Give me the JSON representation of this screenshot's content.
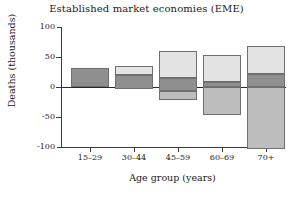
{
  "chart_data": {
    "type": "bar",
    "title": "Established market economies (EME)",
    "xlabel": "Age group (years)",
    "ylabel": "Deaths (thousands)",
    "categories": [
      "15–29",
      "30–44",
      "45–59",
      "60–69",
      "70+"
    ],
    "yticks": [
      100,
      50,
      0,
      -50,
      -100
    ],
    "ylim": [
      -100,
      100
    ],
    "grid": false,
    "legend": "none",
    "stacked": true,
    "series": [
      {
        "name": "upper-light-segment",
        "color": "#e3e3e3",
        "values": [
          0,
          15,
          44,
          46,
          47
        ]
      },
      {
        "name": "middle-dark-segment",
        "color": "#8f8f8f",
        "values": [
          32,
          24,
          22,
          8,
          22
        ]
      },
      {
        "name": "lower-gray-segment",
        "color": "#bdbdbd",
        "values": [
          0,
          -3,
          -22,
          -46,
          -104
        ]
      }
    ],
    "bars": [
      {
        "category": "15–29",
        "top": 32,
        "dark_top": 32,
        "dark_bottom": 0,
        "bottom": 0
      },
      {
        "category": "30–44",
        "top": 36,
        "dark_top": 21,
        "dark_bottom": -3,
        "bottom": -3
      },
      {
        "category": "45–59",
        "top": 60,
        "dark_top": 16,
        "dark_bottom": -6,
        "bottom": -22
      },
      {
        "category": "60–69",
        "top": 54,
        "dark_top": 8,
        "dark_bottom": 0,
        "bottom": -46
      },
      {
        "category": "70+",
        "top": 69,
        "dark_top": 22,
        "dark_bottom": 0,
        "bottom": -104
      }
    ]
  },
  "axes": {
    "y_tick_labels": [
      "100",
      "50",
      "0",
      "-50",
      "-100"
    ],
    "x_tick_labels": [
      "15–29",
      "30–44",
      "45–59",
      "60–69",
      "70+"
    ]
  },
  "colors": {
    "light": "#e3e3e3",
    "dark": "#8f8f8f",
    "mid": "#bdbdbd",
    "outline": "#6f6f6f",
    "axis": "#3a3a3a",
    "text": "#1a1a1a",
    "background": "#ffffff"
  }
}
